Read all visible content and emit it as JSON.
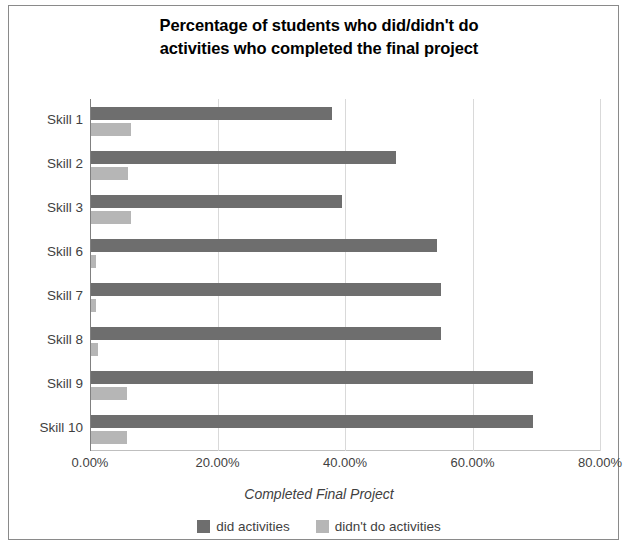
{
  "chart_data": {
    "type": "bar",
    "orientation": "horizontal",
    "title": "Percentage of students who did/didn't do activities who completed the final project",
    "title_line1": "Percentage of students who did/didn't do",
    "title_line2": "activities who completed the final project",
    "xlabel": "Completed Final Project",
    "ylabel": "",
    "categories": [
      "Skill 1",
      "Skill 2",
      "Skill 3",
      "Skill 6",
      "Skill 7",
      "Skill 8",
      "Skill 9",
      "Skill 10"
    ],
    "series": [
      {
        "name": "did activities",
        "color": "#6e6e6e",
        "values": [
          38.0,
          48.0,
          39.5,
          54.5,
          55.0,
          55.0,
          69.5,
          69.5
        ]
      },
      {
        "name": "didn't do activities",
        "color": "#b6b6b6",
        "values": [
          6.5,
          6.0,
          6.5,
          1.0,
          1.0,
          1.2,
          5.8,
          5.8
        ]
      }
    ],
    "xlim": [
      0,
      80
    ],
    "xticks": [
      0,
      20,
      40,
      60,
      80
    ],
    "xtick_labels": [
      "0.00%",
      "20.00%",
      "40.00%",
      "60.00%",
      "80.00%"
    ],
    "grid": "vertical",
    "legend_position": "bottom"
  }
}
